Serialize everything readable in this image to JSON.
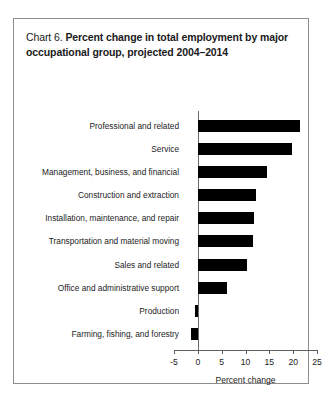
{
  "chart_data": {
    "type": "bar",
    "orientation": "horizontal",
    "title_prefix": "Chart 6.",
    "title": "Percent change in total employment by major occupational group, projected 2004–2014",
    "title_line1": "Percent change in total employment by",
    "title_line2": "major occupational group, projected 2004–2014",
    "categories": [
      "Professional and related",
      "Service",
      "Management, business, and financial",
      "Construction and extraction",
      "Installation, maintenance, and repair",
      "Transportation and material moving",
      "Sales and related",
      "Office and administrative support",
      "Production",
      "Farming, fishing, and forestry"
    ],
    "values": [
      21.5,
      19.7,
      14.6,
      12.3,
      11.8,
      11.6,
      10.3,
      6.2,
      -0.6,
      -1.5
    ],
    "xlabel": "Percent change",
    "ylabel": "",
    "xlim": [
      -5,
      25
    ],
    "xticks": [
      -5,
      0,
      5,
      10,
      15,
      20,
      25
    ],
    "xtick_labels": [
      "-5",
      "0",
      "5",
      "10",
      "15",
      "20",
      "25"
    ],
    "grid": false,
    "legend": null,
    "bar_color": "#000000",
    "background_color": "#ffffff",
    "border_color": "#8d8d8d"
  }
}
